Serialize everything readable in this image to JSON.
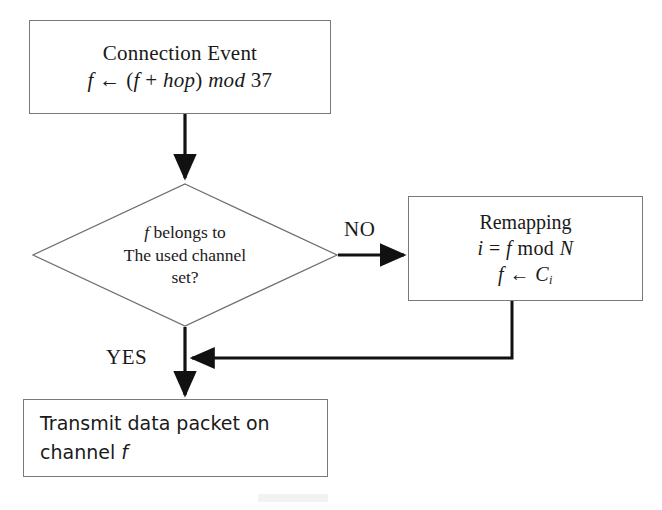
{
  "diagram": {
    "type": "flowchart",
    "background_color": "#ffffff",
    "line_color": "#7a7a7a",
    "arrow_color": "#111111",
    "text_color": "#1a1a1a"
  },
  "nodes": {
    "connection_event": {
      "shape": "rectangle",
      "line1": "Connection Event",
      "line2_math": "f ← (f + hop) mod 37",
      "line2_parts": {
        "f": "f",
        "arrow": "←",
        "open": "(",
        "f2": "f",
        "plus": "+",
        "hop": "hop",
        "close": ")",
        "mod": "mod",
        "value": "37"
      }
    },
    "decision": {
      "shape": "diamond",
      "line1_italic": "f",
      "line1_rest": " belongs to",
      "line2": "The used channel",
      "line3": "set?"
    },
    "remapping": {
      "shape": "rectangle",
      "line1": "Remapping",
      "line2_math": "i = f mod N",
      "line2_parts": {
        "i": "i",
        "eq": "=",
        "f": "f",
        "mod": "mod",
        "N": "N"
      },
      "line3_math": "f ← Cᵢ",
      "line3_parts": {
        "f": "f",
        "arrow": "←",
        "C": "C",
        "sub": "i"
      }
    },
    "transmit": {
      "shape": "rectangle",
      "line1": "Transmit data packet on",
      "line2_prefix": "channel ",
      "line2_italic": "f"
    }
  },
  "edges": {
    "no_label": "NO",
    "yes_label": "YES",
    "connections": [
      {
        "from": "connection_event",
        "to": "decision",
        "label": ""
      },
      {
        "from": "decision",
        "to": "remapping",
        "label": "NO"
      },
      {
        "from": "remapping",
        "to": "transmit",
        "label": ""
      },
      {
        "from": "decision",
        "to": "transmit",
        "label": "YES"
      }
    ]
  }
}
